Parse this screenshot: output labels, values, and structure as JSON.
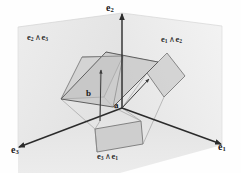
{
  "figure": {
    "type": "geometric-diagram",
    "background_color": "#fefefe"
  },
  "axes": [
    {
      "id": "e2",
      "base": "e",
      "sub": "2",
      "name": "axis-label-e2",
      "x": 106,
      "y": 4,
      "arrow": true
    },
    {
      "id": "e3",
      "base": "e",
      "sub": "3",
      "name": "axis-label-e3",
      "x": 12,
      "y": 146,
      "arrow": true
    },
    {
      "id": "e1",
      "base": "e",
      "sub": "1",
      "name": "axis-label-e1",
      "x": 219,
      "y": 143,
      "arrow": true
    }
  ],
  "planes": [
    {
      "id": "e2^e3",
      "left": "e",
      "left_sub": "2",
      "wedge": "∧",
      "right": "e",
      "right_sub": "3",
      "name": "plane-label-e2-wedge-e3",
      "x": 27,
      "y": 33
    },
    {
      "id": "e1^e2",
      "left": "e",
      "left_sub": "1",
      "wedge": "∧",
      "right": "e",
      "right_sub": "2",
      "name": "plane-label-e1-wedge-e2",
      "x": 160,
      "y": 35
    },
    {
      "id": "e3^e1",
      "left": "e",
      "left_sub": "3",
      "wedge": "∧",
      "right": "e",
      "right_sub": "1",
      "name": "plane-label-e3-wedge-e1",
      "x": 96,
      "y": 152
    }
  ],
  "vectors": [
    {
      "id": "a",
      "label": "a",
      "name": "vector-label-a",
      "x": 113,
      "y": 99,
      "tip_x": 148,
      "tip_y": 80,
      "origin_x": 122,
      "origin_y": 108
    },
    {
      "id": "b",
      "label": "b",
      "name": "vector-label-b",
      "x": 85,
      "y": 90,
      "tip_x": 101,
      "tip_y": 71,
      "origin_x": 100,
      "origin_y": 121
    }
  ],
  "colors": {
    "axis_line": "#2b2b2b",
    "wall_back_left": "#e8e8e8",
    "wall_back_right": "#efefef",
    "wall_floor": "#e4e4e4",
    "parallelogram_fill": "#c9c9c9",
    "parallelogram_stroke": "#6a6a6a",
    "projection_fill": "#cfcfcf",
    "projection_stroke": "#7a7a7a",
    "guide_line": "#8c8c8c",
    "text": "#1a1a1a"
  },
  "geometry": {
    "origin": {
      "x": 122,
      "y": 108
    },
    "main_parallelogram": [
      {
        "x": 61,
        "y": 99
      },
      {
        "x": 106,
        "y": 52
      },
      {
        "x": 158,
        "y": 62
      },
      {
        "x": 113,
        "y": 107
      }
    ],
    "main_parallelogram_top": [
      {
        "x": 61,
        "y": 99
      },
      {
        "x": 106,
        "y": 52
      },
      {
        "x": 158,
        "y": 62
      },
      {
        "x": 113,
        "y": 107
      }
    ],
    "projection_e2_e3": [
      {
        "x": 61,
        "y": 99
      },
      {
        "x": 82,
        "y": 57
      },
      {
        "x": 123,
        "y": 56
      },
      {
        "x": 104,
        "y": 97
      }
    ],
    "projection_e1_e2": [
      {
        "x": 146,
        "y": 72
      },
      {
        "x": 166,
        "y": 53
      },
      {
        "x": 184,
        "y": 75
      },
      {
        "x": 163,
        "y": 96
      }
    ],
    "projection_e3_e1": [
      {
        "x": 95,
        "y": 129
      },
      {
        "x": 140,
        "y": 122
      },
      {
        "x": 142,
        "y": 144
      },
      {
        "x": 97,
        "y": 151
      }
    ]
  }
}
